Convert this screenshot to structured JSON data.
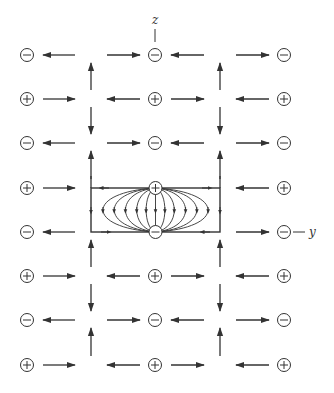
{
  "diagram": {
    "axis_labels": {
      "z": "z",
      "y": "y"
    },
    "colors": {
      "stroke": "#333333",
      "background": "#ffffff"
    },
    "charge_columns_x": [
      27,
      155,
      284
    ],
    "arrow_columns_x": [
      91,
      220
    ],
    "rows": [
      {
        "y": 55,
        "sign": "-"
      },
      {
        "y": 99,
        "sign": "+"
      },
      {
        "y": 143,
        "sign": "-"
      },
      {
        "y": 188,
        "sign": "+"
      },
      {
        "y": 232,
        "sign": "-"
      },
      {
        "y": 276,
        "sign": "+"
      },
      {
        "y": 320,
        "sign": "-"
      },
      {
        "y": 365,
        "sign": "+"
      }
    ],
    "vertical_arrows": [
      {
        "between_rows": [
          0,
          1
        ],
        "direction": "up"
      },
      {
        "between_rows": [
          1,
          2
        ],
        "direction": "down"
      },
      {
        "between_rows": [
          2,
          3
        ],
        "direction": "up"
      },
      {
        "between_rows": [
          4,
          5
        ],
        "direction": "up"
      },
      {
        "between_rows": [
          5,
          6
        ],
        "direction": "down"
      },
      {
        "between_rows": [
          6,
          7
        ],
        "direction": "up"
      }
    ],
    "central_box": {
      "x": 91,
      "y": 188,
      "width": 129,
      "height": 44,
      "source_charge": "+",
      "sink_charge": "-",
      "field_lines": 9
    }
  }
}
